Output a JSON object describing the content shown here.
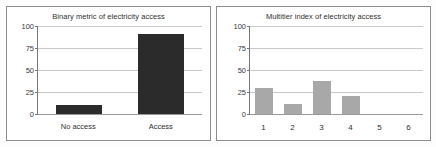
{
  "figure": {
    "panels": [
      "binary",
      "multitier"
    ]
  },
  "chart_data": [
    {
      "id": "binary",
      "type": "bar",
      "title": "Binary metric of electricity access",
      "xlabel": "",
      "ylabel": "",
      "categories": [
        "No access",
        "Access"
      ],
      "values": [
        10,
        91
      ],
      "ylim": [
        0,
        100
      ],
      "yticks": [
        0,
        25,
        50,
        75,
        100
      ],
      "ytick_labels": [
        "0",
        "25",
        "50",
        "75",
        "100"
      ],
      "bar_color": "#2b2b2b",
      "grid": "horizontal",
      "legend": "none"
    },
    {
      "id": "multitier",
      "type": "bar",
      "title": "Multitier index of electricity access",
      "xlabel": "",
      "ylabel": "",
      "categories": [
        "1",
        "2",
        "3",
        "4",
        "5",
        "6"
      ],
      "values": [
        30,
        11,
        38,
        21,
        0,
        0
      ],
      "ylim": [
        0,
        100
      ],
      "yticks": [
        0,
        25,
        50,
        75,
        100
      ],
      "ytick_labels": [
        "0",
        "25",
        "50",
        "75",
        "100"
      ],
      "bar_color": "#a8a8a8",
      "grid": "horizontal",
      "legend": "none"
    }
  ]
}
